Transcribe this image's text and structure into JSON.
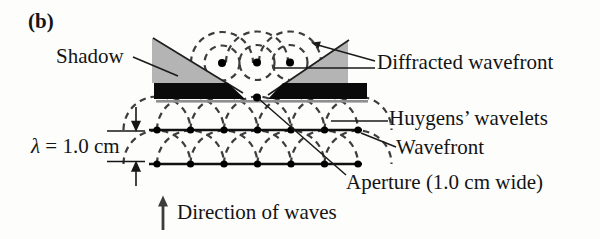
{
  "panel": {
    "label": "(b)"
  },
  "labels": {
    "shadow": "Shadow",
    "diffracted_wavefront": "Diffracted wavefront",
    "huygens_wavelets": "Huygens’ wavelets",
    "wavefront": "Wavefront",
    "aperture": "Aperture (1.0 cm wide)",
    "wavelength_symbol": "λ",
    "wavelength_value": " = 1.0 cm",
    "direction_of_waves": "Direction of waves"
  },
  "physics": {
    "wavelength_cm": 1.0,
    "aperture_width_cm": 1.0
  },
  "colors": {
    "background": "#fdfdfc",
    "barrier": "#0a0a0a",
    "barrier_underline": "#8f8f8f",
    "shadow_fill": "#b4b4b4",
    "wavelet_dash": "#3d3d3d",
    "wavefront_line": "#111111",
    "leader_line": "#1a1a1a"
  }
}
